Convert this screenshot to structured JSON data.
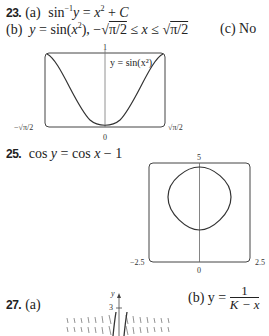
{
  "problems": [
    {
      "number": "23.",
      "parts": [
        {
          "label": "(a)",
          "text": "sin⁻¹y = x² + C"
        },
        {
          "label": "(b)",
          "text": "y = sin(x²), −√(π/2) ≤ x ≤ √(π/2)"
        },
        {
          "label": "(c)",
          "text": "No"
        }
      ],
      "graph": {
        "curve_label": "y = sin(x²)",
        "y_top_tick": "1",
        "x_left_tick": "−√π/2",
        "x_right_tick": "√π/2",
        "origin_tick": "0"
      }
    },
    {
      "number": "25.",
      "equation": "cos y = cos x − 1",
      "graph": {
        "y_top_tick": "5",
        "x_left_tick": "−2.5",
        "x_right_tick": "2.5",
        "origin_tick": "0"
      }
    },
    {
      "number": "27.",
      "parts": [
        {
          "label": "(a)",
          "text": ""
        },
        {
          "label": "(b)",
          "text": "y = 1/(K − x)",
          "lhs": "y =",
          "numerator": "1",
          "denominator": "K − x"
        }
      ],
      "graph": {
        "y_axis_label": "y",
        "y_tick": "3"
      }
    }
  ]
}
